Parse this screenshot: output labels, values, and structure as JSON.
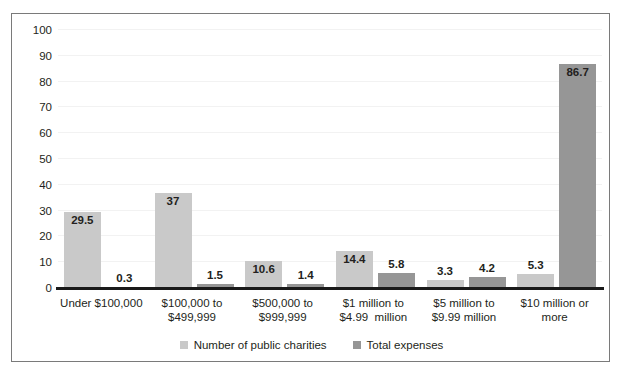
{
  "chart_data": {
    "type": "bar",
    "title": "",
    "xlabel": "",
    "ylabel": "",
    "ylim": [
      0,
      100
    ],
    "yticks": [
      0,
      10,
      20,
      30,
      40,
      50,
      60,
      70,
      80,
      90,
      100
    ],
    "grid": true,
    "legend_position": "bottom",
    "categories": [
      [
        "Under $100,000",
        ""
      ],
      [
        "$100,000 to",
        "$499,999"
      ],
      [
        "$500,000 to",
        "$999,999"
      ],
      [
        "$1 million to",
        "$4.99  million"
      ],
      [
        "$5 million to",
        "$9.99 million"
      ],
      [
        "$10 million or",
        "more"
      ]
    ],
    "series": [
      {
        "name": "Number of public charities",
        "color": "#c9c9c9",
        "values": [
          29.5,
          37,
          10.6,
          14.4,
          3.3,
          5.3
        ],
        "labels": [
          "29.5",
          "37",
          "10.6",
          "14.4",
          "3.3",
          "5.3"
        ]
      },
      {
        "name": "Total expenses",
        "color": "#969696",
        "values": [
          0.3,
          1.5,
          1.4,
          5.8,
          4.2,
          86.7
        ],
        "labels": [
          "0.3",
          "1.5",
          "1.4",
          "5.8",
          "4.2",
          "86.7"
        ]
      }
    ]
  },
  "colors": {
    "series_light": "#c9c9c9",
    "series_dark": "#969696",
    "axis": "#1a1a1a",
    "border": "#7a7a7a",
    "text": "#231f20",
    "gridline": "#f2f2f2"
  }
}
